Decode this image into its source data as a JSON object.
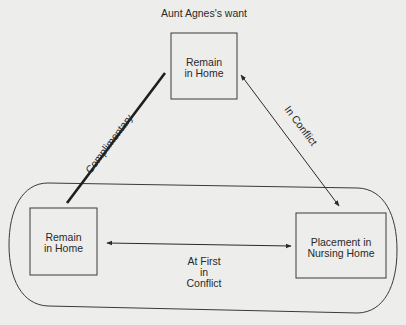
{
  "diagram": {
    "title": "Aunt Agnes's want",
    "nodes": {
      "top": {
        "line1": "Remain",
        "line2": "in Home"
      },
      "left": {
        "line1": "Remain",
        "line2": "in Home"
      },
      "right": {
        "line1": "Placement in",
        "line2": "Nursing Home"
      }
    },
    "edges": {
      "top_left": {
        "label": "Complimentary",
        "style": "thick line, no arrows"
      },
      "top_right": {
        "label": "In Conflict",
        "style": "double-headed arrow"
      },
      "left_right": {
        "line1": "At First",
        "line2": "in",
        "line3": "Conflict",
        "style": "double-headed arrow"
      }
    },
    "colors": {
      "background": "#ededeb",
      "ink": "#2a2a2a"
    }
  }
}
